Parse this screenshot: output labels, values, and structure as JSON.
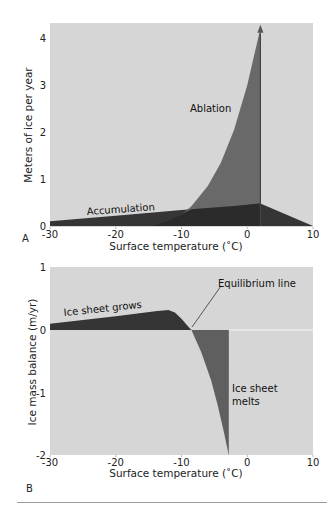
{
  "colors": {
    "plot_bg": "#d6d6d6",
    "ablation": "#5f5f5f",
    "accumulation": "#353535",
    "overlap": "#2b2b2b",
    "growth": "#353535",
    "melt": "#5f5f5f",
    "zero_line": "#f4f4f4"
  },
  "chart_data": [
    {
      "panel": "A",
      "type": "area",
      "title": "",
      "xlabel": "Surface temperature (˚C)",
      "ylabel": "Meters of ice per year",
      "xlim": [
        -30,
        10
      ],
      "ylim": [
        0,
        4.3
      ],
      "xticks": [
        -30,
        -20,
        -10,
        0,
        10
      ],
      "yticks": [
        0,
        1,
        2,
        3,
        4
      ],
      "grid": false,
      "series": [
        {
          "name": "Accumulation",
          "x": [
            -30,
            -20,
            -10,
            0,
            2,
            10
          ],
          "y": [
            0.1,
            0.22,
            0.34,
            0.45,
            0.48,
            0.0
          ]
        },
        {
          "name": "Ablation",
          "x": [
            -14.8,
            -12,
            -10,
            -8.5,
            -6,
            -4,
            -2,
            0,
            1,
            2
          ],
          "y": [
            0.0,
            0.12,
            0.25,
            0.42,
            0.85,
            1.35,
            2.05,
            3.0,
            3.6,
            4.2
          ]
        }
      ],
      "annotations": [
        {
          "text": "Ablation",
          "x": -5.5,
          "y": 2.45
        },
        {
          "text": "Accumulation",
          "x": -25,
          "y": 0.28
        },
        {
          "text": "arrow at 2˚C pointing up",
          "x": 2,
          "y": 4.2
        }
      ]
    },
    {
      "panel": "B",
      "type": "area",
      "title": "",
      "xlabel": "Surface temperature (˚C)",
      "ylabel": "Ice mass balance (m/yr)",
      "xlim": [
        -30,
        10
      ],
      "ylim": [
        -2,
        1
      ],
      "xticks": [
        -30,
        -20,
        -10,
        0,
        10
      ],
      "yticks": [
        -2,
        -1,
        0,
        1
      ],
      "grid": false,
      "series": [
        {
          "name": "Ice sheet grows",
          "x": [
            -30,
            -20,
            -14,
            -12,
            -11,
            -10,
            -9.2,
            -8.5
          ],
          "y": [
            0.1,
            0.22,
            0.3,
            0.32,
            0.28,
            0.18,
            0.08,
            0.0
          ]
        },
        {
          "name": "Ice sheet melts",
          "x": [
            -8.5,
            -7,
            -5.5,
            -4.5,
            -3.5,
            -2.8
          ],
          "y": [
            0.0,
            -0.35,
            -0.8,
            -1.2,
            -1.65,
            -2.0
          ]
        }
      ],
      "annotations": [
        {
          "text": "Ice sheet grows",
          "x": -27,
          "y": 0.22
        },
        {
          "text": "Equilibrium line",
          "x": -6,
          "y": 0.68
        },
        {
          "text": "Ice sheet",
          "x": -1.5,
          "y": -0.95
        },
        {
          "text": "melts",
          "x": -1.5,
          "y": -1.18
        }
      ]
    }
  ],
  "panelA": {
    "label": "A",
    "ylabel": "Meters of ice per year",
    "xlabel": "Surface temperature (˚C)",
    "xticks": [
      "-30",
      "-20",
      "-10",
      "0",
      "10"
    ],
    "yticks": [
      "0",
      "1",
      "2",
      "3",
      "4"
    ],
    "ablation_label": "Ablation",
    "accumulation_label": "Accumulation"
  },
  "panelB": {
    "label": "B",
    "ylabel": "Ice mass balance (m/yr)",
    "xlabel": "Surface temperature (˚C)",
    "xticks": [
      "-30",
      "-20",
      "-10",
      "0",
      "10"
    ],
    "yticks": [
      "1",
      "0",
      "-1",
      "-2"
    ],
    "grows_label": "Ice sheet grows",
    "equilibrium_label": "Equilibrium line",
    "melts_label_1": "Ice sheet",
    "melts_label_2": "melts"
  }
}
